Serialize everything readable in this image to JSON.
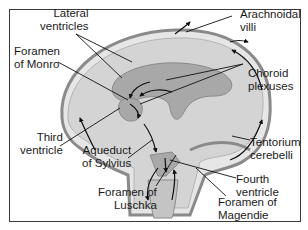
{
  "diagram": {
    "type": "anatomical-illustration",
    "colors": {
      "border": "#3a3a3a",
      "brain_fill": "#d4d4d4",
      "ventricle_fill": "#a8a8a8",
      "membrane": "#8a8a8a",
      "arrow": "#111111",
      "text": "#1a1a1a"
    },
    "labels": {
      "lateral_ventricles": "Lateral\nventricles",
      "foramen_of_monro": "Foramen\nof Monro",
      "arachnoidal_villi": "Arachnoidal\nvilli",
      "choroid_plexuses": "Choroid\nplexuses",
      "third_ventricle": "Third\nventricle",
      "aqueduct_of_sylvius": "Aqueduct\nof Sylvius",
      "tentorium_cerebelli": "Tentorium\ncerebelli",
      "fourth_ventricle": "Fourth\nventricle",
      "foramen_of_luschka": "Foramen of\nLuschka",
      "foramen_of_magendie": "Foramen of\nMagendie"
    }
  }
}
